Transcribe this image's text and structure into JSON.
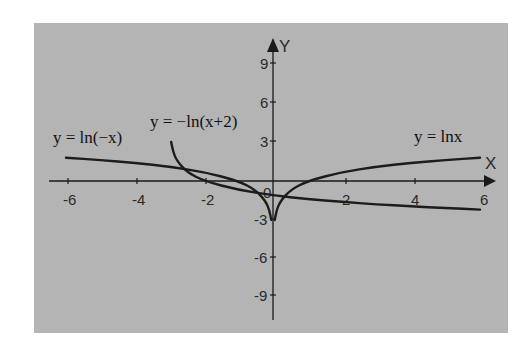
{
  "chart_data": {
    "type": "line",
    "title": "",
    "xlabel": "X",
    "ylabel": "Y",
    "xlim": [
      -6.5,
      6.3
    ],
    "ylim": [
      -10.5,
      10.5
    ],
    "grid": false,
    "legend_position": "inline labels",
    "x_ticks": [
      -6,
      -4,
      -2,
      0,
      2,
      4,
      6
    ],
    "x_tick_labels": [
      "-6",
      "-4",
      "-2",
      "0",
      "2",
      "4",
      "6"
    ],
    "y_ticks": [
      -9,
      -6,
      -3,
      3,
      6,
      9
    ],
    "y_tick_labels": [
      "-9",
      "-6",
      "-3",
      "3",
      "6",
      "9"
    ],
    "series": [
      {
        "name": "y = ln(-x)",
        "x": [
          -6,
          -5,
          -4,
          -3,
          -2,
          -1,
          -0.5,
          -0.2,
          -0.1,
          -0.05
        ],
        "values": [
          1.79,
          1.61,
          1.39,
          1.1,
          0.69,
          0,
          -0.69,
          -1.61,
          -2.3,
          -3.0
        ]
      },
      {
        "name": "y = lnx",
        "x": [
          0.05,
          0.1,
          0.2,
          0.5,
          1,
          2,
          3,
          4,
          5,
          6
        ],
        "values": [
          -3.0,
          -2.3,
          -1.61,
          -0.69,
          0,
          0.69,
          1.1,
          1.39,
          1.61,
          1.79
        ]
      },
      {
        "name": "y = −ln(x+2)",
        "x": [
          -2.95,
          -2.9,
          -2.8,
          -2.5,
          -2,
          -1,
          0,
          1,
          2,
          3,
          4,
          5,
          6
        ],
        "values": [
          3.0,
          2.3,
          1.61,
          0.69,
          0,
          -0.69,
          -1.1,
          -1.39,
          -1.61,
          -1.79,
          -1.95,
          -2.08,
          -2.2
        ]
      }
    ],
    "annotations": [
      "y = ln(−x)",
      "y = −ln(x+2)",
      "y = lnx"
    ]
  },
  "labels": {
    "x_axis": "X",
    "y_axis": "Y",
    "origin": "0",
    "eq_left": "y = ln(−x)",
    "eq_middle": "y = −ln(x+2)",
    "eq_right": "y = lnx"
  },
  "ticks": {
    "x": [
      "-6",
      "-4",
      "-2",
      "2",
      "4",
      "6"
    ],
    "y": [
      "9",
      "6",
      "3",
      "-3",
      "-6",
      "-9"
    ]
  }
}
